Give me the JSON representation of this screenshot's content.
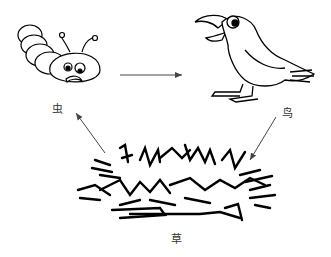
{
  "diagram": {
    "type": "food-chain",
    "nodes": [
      {
        "id": "insect",
        "label": "虫"
      },
      {
        "id": "bird",
        "label": "鸟"
      },
      {
        "id": "grass",
        "label": "草"
      }
    ],
    "edges": [
      {
        "from": "insect",
        "to": "bird"
      },
      {
        "from": "grass",
        "to": "insect"
      },
      {
        "from": "bird",
        "to": "grass"
      }
    ],
    "colors": {
      "stroke": "#000000",
      "arrow": "#444444",
      "label": "#333333"
    }
  }
}
